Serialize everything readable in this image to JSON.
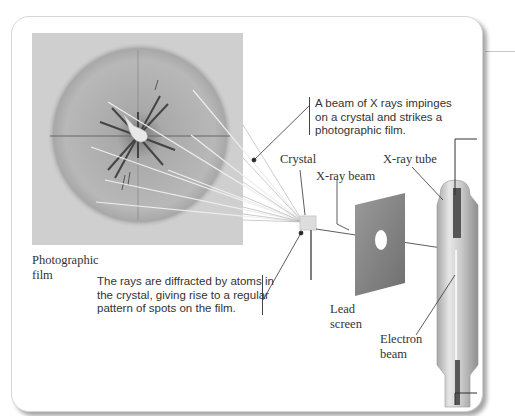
{
  "labels": {
    "photographic_film": [
      "Photographic",
      "film"
    ],
    "crystal": "Crystal",
    "xray_beam": "X-ray beam",
    "xray_tube": "X-ray tube",
    "lead_screen": [
      "Lead",
      "screen"
    ],
    "electron_beam": [
      "Electron",
      "beam"
    ]
  },
  "captions": {
    "beam": [
      "A beam of X rays impinges",
      "on a crystal and strikes a",
      "photographic film."
    ],
    "diffraction": [
      "The rays are diffracted by atoms in",
      "the crystal, giving rise to a regular",
      "pattern of spots on the film."
    ]
  },
  "colors": {
    "film_bg": "#cfcfcf",
    "panel_border": "#d6d6d6",
    "text": "#333333",
    "lead_screen": "#8a8a8a"
  }
}
